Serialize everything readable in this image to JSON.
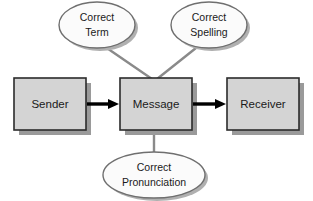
{
  "diagram": {
    "type": "flow-diagram",
    "background_color": "#ffffff",
    "box_fill": "#d4d4d4",
    "box_stroke": "#2b2b2b",
    "box_shadow": "#9a9a9a",
    "ellipse_fill": "#fbfbfb",
    "ellipse_stroke": "#6f6f6f",
    "ellipse_shadow": "#b0b0b0",
    "connector_color": "#8a8a8a",
    "arrow_color": "#000000",
    "boxes": [
      {
        "id": "sender",
        "label": "Sender"
      },
      {
        "id": "message",
        "label": "Message"
      },
      {
        "id": "receiver",
        "label": "Receiver"
      }
    ],
    "ellipses": [
      {
        "id": "correct-term",
        "label_line1": "Correct",
        "label_line2": "Term"
      },
      {
        "id": "correct-spelling",
        "label_line1": "Correct",
        "label_line2": "Spelling"
      },
      {
        "id": "correct-pronunciation",
        "label_line1": "Correct",
        "label_line2": "Pronunciation"
      }
    ],
    "arrows": [
      {
        "id": "sender-to-message",
        "from": "sender",
        "to": "message"
      },
      {
        "id": "message-to-receiver",
        "from": "message",
        "to": "receiver"
      }
    ],
    "connectors": [
      {
        "id": "term-to-message",
        "from": "correct-term",
        "to": "message"
      },
      {
        "id": "spelling-to-message",
        "from": "correct-spelling",
        "to": "message"
      },
      {
        "id": "pronunciation-to-message",
        "from": "correct-pronunciation",
        "to": "message"
      }
    ]
  }
}
